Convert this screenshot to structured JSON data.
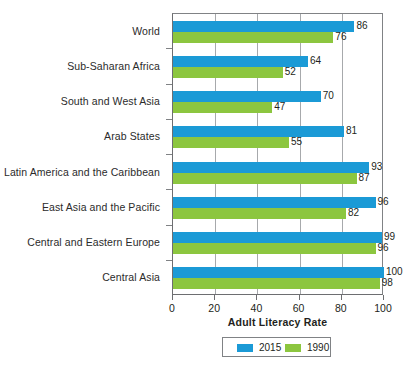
{
  "chart_data": {
    "type": "bar",
    "orientation": "horizontal",
    "title": "",
    "xlabel": "Adult Literacy Rate",
    "ylabel": "",
    "xlim": [
      0,
      100
    ],
    "xticks": [
      0,
      20,
      40,
      60,
      80,
      100
    ],
    "xtick_labels": [
      "0",
      "20",
      "40",
      "60",
      "80",
      "100"
    ],
    "grid": "vertical",
    "legend_position": "bottom-center",
    "categories": [
      "World",
      "Sub-Saharan Africa",
      "South and West Asia",
      "Arab States",
      "Latin America and the Caribbean",
      "East Asia and the Pacific",
      "Central and Eastern Europe",
      "Central Asia"
    ],
    "series": [
      {
        "name": "2015",
        "color": "#1b9ad6",
        "values": [
          86,
          64,
          70,
          81,
          93,
          96,
          99,
          100
        ]
      },
      {
        "name": "1990",
        "color": "#8cc63f",
        "values": [
          76,
          52,
          47,
          55,
          87,
          82,
          96,
          98
        ]
      }
    ]
  },
  "legend": {
    "items": [
      {
        "label": "2015",
        "color": "#1b9ad6"
      },
      {
        "label": "1990",
        "color": "#8cc63f"
      }
    ]
  },
  "axis": {
    "x_title": "Adult Literacy Rate"
  }
}
